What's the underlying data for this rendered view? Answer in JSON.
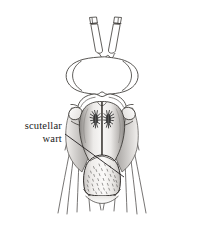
{
  "figure": {
    "background_color": "#ffffff",
    "ink_color": "#231f20",
    "line_color": "#3a3a3a"
  },
  "annotations": [
    {
      "id": "scutellar-wart",
      "line1": "scutellar",
      "line2": "wart",
      "text_anchor_x": 62,
      "text_line1_y": 129,
      "text_line2_y": 142,
      "leader_start_x": 65,
      "leader_start_y": 134,
      "leader_end_x": 124,
      "leader_end_y": 177
    }
  ],
  "anatomy": {
    "antennae": {
      "name": "antennae",
      "count": 2,
      "description": "two elongate basal segments angled outward with short terminal segments"
    },
    "head": {
      "name": "head",
      "description": "broad oval head with large lateral compound eyes and wavy posterior margin"
    },
    "thorax": {
      "name": "mesonotum",
      "description": "shaded shield-shaped thorax with median longitudinal suture"
    },
    "warts": {
      "name": "mesoscutal warts",
      "count": 2,
      "description": "paired dark bristly setal tufts on the mesoscutum"
    },
    "scutellum": {
      "name": "scutellum",
      "description": "rounded posterior plate densely covered with fine setae (the scutellar wart)"
    },
    "wing_bases": {
      "name": "wing bases",
      "count": 2,
      "description": "small oval lobes lateral to the thorax"
    },
    "legs": {
      "name": "legs",
      "count": 6,
      "description": "slender tapering legs fanning downward on both sides"
    }
  },
  "shading": {
    "thorax_light": "#f4f2f0",
    "thorax_mid": "#c9c6c3",
    "thorax_dark": "#8e8b88",
    "scutellum_light": "#f7f6f4",
    "scutellum_mid": "#d6d3d0",
    "wart_color": "#2b2b2b",
    "stipple_color": "#4a4a4a"
  }
}
